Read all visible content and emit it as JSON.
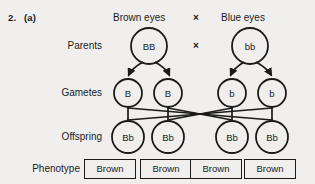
{
  "question": {
    "number": "2.",
    "part": "(a)"
  },
  "header": {
    "left_phenotype": "Brown eyes",
    "cross_symbol": "×",
    "right_phenotype": "Blue eyes"
  },
  "rows": {
    "parents_label": "Parents",
    "gametes_label": "Gametes",
    "offspring_label": "Offspring",
    "phenotype_label": "Phenotype"
  },
  "parents": {
    "cross_symbol": "×",
    "circles": [
      {
        "genotype": "BB",
        "cx": 149,
        "cy": 46,
        "r": 18
      },
      {
        "genotype": "bb",
        "cx": 250,
        "cy": 46,
        "r": 18
      }
    ]
  },
  "gametes": {
    "circles": [
      {
        "allele": "B",
        "cx": 128,
        "cy": 93,
        "r": 14
      },
      {
        "allele": "B",
        "cx": 168,
        "cy": 93,
        "r": 14
      },
      {
        "allele": "b",
        "cx": 232,
        "cy": 93,
        "r": 14
      },
      {
        "allele": "b",
        "cx": 272,
        "cy": 93,
        "r": 14
      }
    ]
  },
  "offspring": {
    "circles": [
      {
        "genotype": "Bb",
        "cx": 128,
        "cy": 137,
        "r": 16
      },
      {
        "genotype": "Bb",
        "cx": 168,
        "cy": 137,
        "r": 16
      },
      {
        "genotype": "Bb",
        "cx": 232,
        "cy": 137,
        "r": 16
      },
      {
        "genotype": "Bb",
        "cx": 272,
        "cy": 137,
        "r": 16
      }
    ]
  },
  "phenotypes": {
    "boxes": [
      {
        "label": "Brown",
        "x": 84,
        "y": 159,
        "w": 52,
        "h": 20
      },
      {
        "label": "Brown",
        "x": 140,
        "y": 159,
        "w": 52,
        "h": 20
      },
      {
        "label": "Brown",
        "x": 190,
        "y": 159,
        "w": 52,
        "h": 20
      },
      {
        "label": "Brown",
        "x": 244,
        "y": 159,
        "w": 52,
        "h": 20
      }
    ]
  },
  "colors": {
    "background": "#f0efed",
    "ink": "#1b1b1b",
    "stroke": "#1b1b1b"
  }
}
